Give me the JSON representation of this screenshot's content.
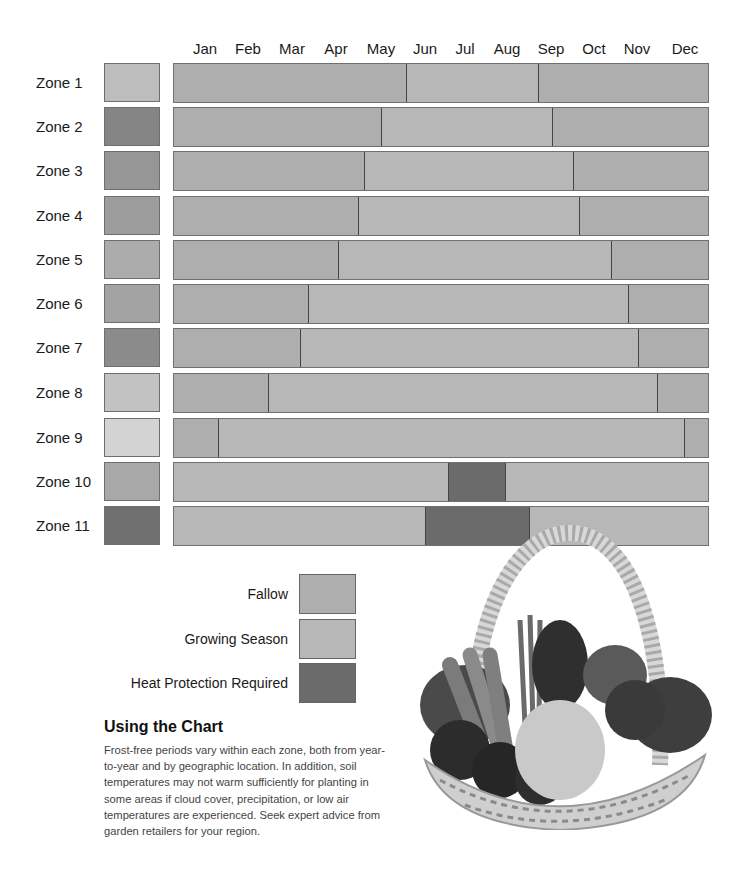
{
  "chart_data": {
    "type": "gantt-bar",
    "title": "",
    "xlabel": "",
    "ylabel": "",
    "categories": [
      "Jan",
      "Feb",
      "Mar",
      "Apr",
      "May",
      "Jun",
      "Jul",
      "Aug",
      "Sep",
      "Oct",
      "Nov",
      "Dec"
    ],
    "x_range": [
      0,
      12
    ],
    "legend": [
      {
        "key": "fallow",
        "label": "Fallow",
        "color": "#aeaeae"
      },
      {
        "key": "growing",
        "label": "Growing Season",
        "color": "#b7b7b7"
      },
      {
        "key": "heat",
        "label": "Heat Protection Required",
        "color": "#6b6b6b"
      }
    ],
    "zones": [
      {
        "name": "Zone 1",
        "swatch": "#bdbdbd",
        "segments": [
          {
            "type": "fallow",
            "start": 0,
            "end": 5.2
          },
          {
            "type": "growing",
            "start": 5.2,
            "end": 8.15
          },
          {
            "type": "fallow",
            "start": 8.15,
            "end": 12
          }
        ]
      },
      {
        "name": "Zone 2",
        "swatch": "#858585",
        "segments": [
          {
            "type": "fallow",
            "start": 0,
            "end": 4.63
          },
          {
            "type": "growing",
            "start": 4.63,
            "end": 8.46
          },
          {
            "type": "fallow",
            "start": 8.46,
            "end": 12
          }
        ]
      },
      {
        "name": "Zone 3",
        "swatch": "#969696",
        "segments": [
          {
            "type": "fallow",
            "start": 0,
            "end": 4.25
          },
          {
            "type": "growing",
            "start": 4.25,
            "end": 8.93
          },
          {
            "type": "fallow",
            "start": 8.93,
            "end": 12
          }
        ]
      },
      {
        "name": "Zone 4",
        "swatch": "#9d9d9d",
        "segments": [
          {
            "type": "fallow",
            "start": 0,
            "end": 4.12
          },
          {
            "type": "growing",
            "start": 4.12,
            "end": 9.06
          },
          {
            "type": "fallow",
            "start": 9.06,
            "end": 12
          }
        ]
      },
      {
        "name": "Zone 5",
        "swatch": "#acacac",
        "segments": [
          {
            "type": "fallow",
            "start": 0,
            "end": 3.67
          },
          {
            "type": "growing",
            "start": 3.67,
            "end": 9.78
          },
          {
            "type": "fallow",
            "start": 9.78,
            "end": 12
          }
        ]
      },
      {
        "name": "Zone 6",
        "swatch": "#a3a3a3",
        "segments": [
          {
            "type": "fallow",
            "start": 0,
            "end": 3.0
          },
          {
            "type": "growing",
            "start": 3.0,
            "end": 10.16
          },
          {
            "type": "fallow",
            "start": 10.16,
            "end": 12
          }
        ]
      },
      {
        "name": "Zone 7",
        "swatch": "#8b8b8b",
        "segments": [
          {
            "type": "fallow",
            "start": 0,
            "end": 2.82
          },
          {
            "type": "growing",
            "start": 2.82,
            "end": 10.39
          },
          {
            "type": "fallow",
            "start": 10.39,
            "end": 12
          }
        ]
      },
      {
        "name": "Zone 8",
        "swatch": "#c2c2c2",
        "segments": [
          {
            "type": "fallow",
            "start": 0,
            "end": 2.1
          },
          {
            "type": "growing",
            "start": 2.1,
            "end": 10.81
          },
          {
            "type": "fallow",
            "start": 10.81,
            "end": 12
          }
        ]
      },
      {
        "name": "Zone 9",
        "swatch": "#d3d3d3",
        "segments": [
          {
            "type": "fallow",
            "start": 0,
            "end": 0.98
          },
          {
            "type": "growing",
            "start": 0.98,
            "end": 11.41
          },
          {
            "type": "fallow",
            "start": 11.41,
            "end": 12
          }
        ]
      },
      {
        "name": "Zone 10",
        "swatch": "#a8a8a8",
        "segments": [
          {
            "type": "growing",
            "start": 0,
            "end": 6.13
          },
          {
            "type": "heat",
            "start": 6.13,
            "end": 7.42
          },
          {
            "type": "growing",
            "start": 7.42,
            "end": 12
          }
        ]
      },
      {
        "name": "Zone 11",
        "swatch": "#6f6f6f",
        "segments": [
          {
            "type": "growing",
            "start": 0,
            "end": 5.62
          },
          {
            "type": "heat",
            "start": 5.62,
            "end": 7.94
          },
          {
            "type": "growing",
            "start": 7.94,
            "end": 12
          }
        ]
      }
    ]
  },
  "months": [
    "Jan",
    "Feb",
    "Mar",
    "Apr",
    "May",
    "Jun",
    "Jul",
    "Aug",
    "Sep",
    "Oct",
    "Nov",
    "Dec"
  ],
  "legend": {
    "fallow": "Fallow",
    "growing": "Growing Season",
    "heat": "Heat Protection Required"
  },
  "info": {
    "heading": "Using the Chart",
    "body": "Frost-free periods vary within each zone, both from year-to-year and by geographic location. In addition, soil temperatures may not warm sufficiently for planting in some areas if cloud cover, precipitation, or low air temperatures are experienced. Seek expert advice from garden retailers for your region."
  },
  "image": {
    "alt": "basket-of-vegetables-photo"
  }
}
